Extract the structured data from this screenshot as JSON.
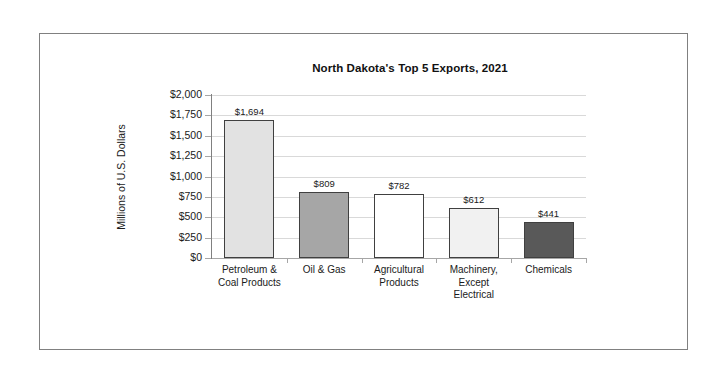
{
  "figure": {
    "border_color": "#808080",
    "background": "#ffffff"
  },
  "chart_data": {
    "type": "bar",
    "title": "North Dakota's Top 5 Exports, 2021",
    "xlabel": "",
    "ylabel": "Millions of U.S. Dollars",
    "ylim": [
      0,
      2000
    ],
    "ytick_step": 250,
    "grid": true,
    "legend": "none",
    "categories": [
      "Petroleum & Coal Products",
      "Oil & Gas",
      "Agricultural Products",
      "Machinery, Except Electrical",
      "Chemicals"
    ],
    "category_lines": [
      [
        "Petroleum &",
        "Coal Products"
      ],
      [
        "Oil & Gas"
      ],
      [
        "Agricultural",
        "Products"
      ],
      [
        "Machinery,",
        "Except",
        "Electrical"
      ],
      [
        "Chemicals"
      ]
    ],
    "values": [
      1694,
      809,
      782,
      612,
      441
    ],
    "value_labels": [
      "$1,694",
      "$809",
      "$782",
      "$612",
      "$441"
    ],
    "ytick_labels": [
      "$2,000",
      "$1,750",
      "$1,500",
      "$1,250",
      "$1,000",
      "$750",
      "$500",
      "$250",
      "$0"
    ],
    "ytick_values": [
      2000,
      1750,
      1500,
      1250,
      1000,
      750,
      500,
      250,
      0
    ],
    "bar_colors": [
      "#e2e2e2",
      "#a6a6a6",
      "#ffffff",
      "#f1f1f1",
      "#595959"
    ],
    "bar_edge_color": "#404040",
    "gridline_color": "#d9d9d9",
    "axis_color": "#808080"
  }
}
